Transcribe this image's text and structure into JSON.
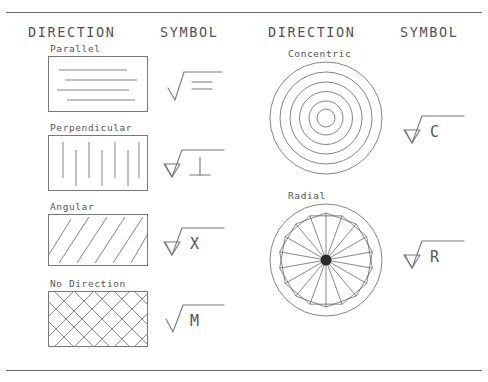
{
  "sheet": {
    "headers": {
      "direction": "DIRECTION",
      "symbol": "SYMBOL"
    },
    "left_column": [
      {
        "label": "Parallel",
        "symbol_char": "=",
        "pattern": "horizontal-lines",
        "has_tick": false
      },
      {
        "label": "Perpendicular",
        "symbol_char": "⊥",
        "pattern": "vertical-lines",
        "has_tick": true
      },
      {
        "label": "Angular",
        "symbol_char": "X",
        "pattern": "diagonal-lines",
        "has_tick": true
      },
      {
        "label": "No Direction",
        "symbol_char": "M",
        "pattern": "crosshatch",
        "has_tick": false
      }
    ],
    "right_column": [
      {
        "label": "Concentric",
        "symbol_char": "C",
        "pattern": "concentric-circles",
        "has_tick": true,
        "ring_count": 6
      },
      {
        "label": "Radial",
        "symbol_char": "R",
        "pattern": "radial-rosette",
        "has_tick": true,
        "petal_count": 18
      }
    ],
    "colors": {
      "line": "#777777",
      "text": "#555555",
      "rule": "#6d6d6d",
      "background": "#ffffff"
    }
  }
}
